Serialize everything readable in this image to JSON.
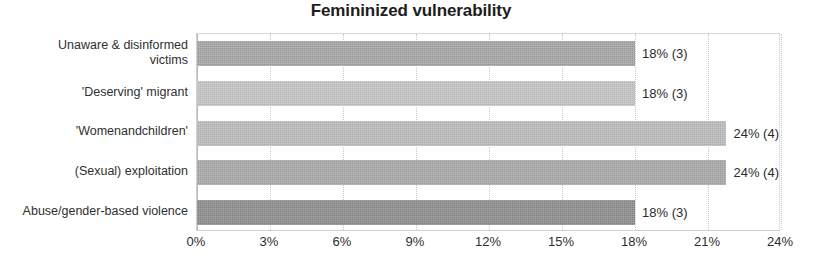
{
  "chart_data": {
    "type": "bar",
    "orientation": "horizontal",
    "title": "Femininized vulnerability",
    "xlabel": "",
    "ylabel": "",
    "xlim": [
      0,
      24
    ],
    "grid": true,
    "legend": false,
    "categories": [
      "Unaware & disinformed victims",
      "'Deserving' migrant",
      "'Womenandchildren'",
      "(Sexual) exploitation",
      "Abuse/gender-based violence"
    ],
    "values": [
      18,
      18,
      24,
      24,
      18
    ],
    "counts": [
      3,
      3,
      4,
      4,
      3
    ],
    "data_labels": [
      "18% (3)",
      "18% (3)",
      "24% (4)",
      "24% (4)",
      "18% (3)"
    ],
    "bar_colors": [
      "#a6a6a6",
      "#c6c6c6",
      "#bdbdbd",
      "#aaaaaa",
      "#8e8e8e"
    ],
    "xticks": [
      "0%",
      "3%",
      "6%",
      "9%",
      "12%",
      "15%",
      "18%",
      "21%",
      "24%"
    ],
    "xtick_values": [
      0,
      3,
      6,
      9,
      12,
      15,
      18,
      21,
      24
    ]
  },
  "category_lines": [
    [
      "Unaware & disinformed",
      "victims"
    ],
    [
      "'Deserving' migrant"
    ],
    [
      "'Womenandchildren'"
    ],
    [
      "(Sexual) exploitation"
    ],
    [
      "Abuse/gender-based violence"
    ]
  ]
}
